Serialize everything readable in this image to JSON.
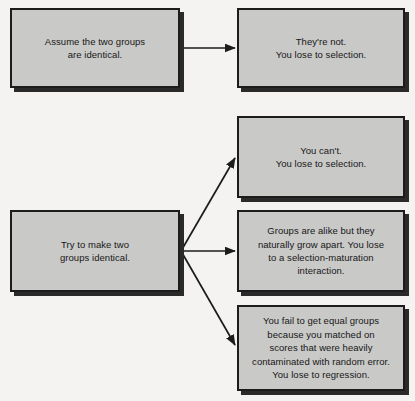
{
  "diagram": {
    "type": "flowchart",
    "title": "",
    "background_color": "#f4f3f1",
    "node_fill_color": "#c9c9c7",
    "node_border_color": "#1c1c1c",
    "node_shadow_color": "#2a2a2a",
    "text_color": "#171717",
    "edge_color": "#1c1c1c",
    "nodes": [
      {
        "id": "assume",
        "label": "Assume the two groups\nare identical.",
        "x": 10,
        "y": 8,
        "width": 170,
        "height": 80
      },
      {
        "id": "theyre-not",
        "label": "They're not.\nYou lose to selection.",
        "x": 237,
        "y": 8,
        "width": 168,
        "height": 80
      },
      {
        "id": "try-make-identical",
        "label": "Try to make two\ngroups identical.",
        "x": 10,
        "y": 210,
        "width": 170,
        "height": 82
      },
      {
        "id": "you-cant",
        "label": "You can't.\nYou lose to selection.",
        "x": 237,
        "y": 116,
        "width": 168,
        "height": 82
      },
      {
        "id": "selection-maturation",
        "label": "Groups are alike but they\nnaturally grow apart. You lose\nto a selection-maturation\ninteraction.",
        "x": 237,
        "y": 210,
        "width": 168,
        "height": 82
      },
      {
        "id": "regression",
        "label": "You fail to get equal groups\nbecause you matched on\nscores that were heavily\ncontaminated with random error.\nYou lose to regression.",
        "x": 237,
        "y": 305,
        "width": 168,
        "height": 86
      }
    ],
    "edges": [
      {
        "id": "edge-assume-to-theyre-not",
        "from": "assume",
        "to": "theyre-not",
        "x1": 181,
        "y1": 48,
        "x2": 235,
        "y2": 48
      },
      {
        "id": "edge-try-to-you-cant",
        "from": "try-make-identical",
        "to": "you-cant",
        "x1": 181,
        "y1": 251,
        "x2": 235,
        "y2": 158
      },
      {
        "id": "edge-try-to-selection-maturation",
        "from": "try-make-identical",
        "to": "selection-maturation",
        "x1": 181,
        "y1": 251,
        "x2": 235,
        "y2": 251
      },
      {
        "id": "edge-try-to-regression",
        "from": "try-make-identical",
        "to": "regression",
        "x1": 181,
        "y1": 251,
        "x2": 235,
        "y2": 345
      }
    ]
  }
}
